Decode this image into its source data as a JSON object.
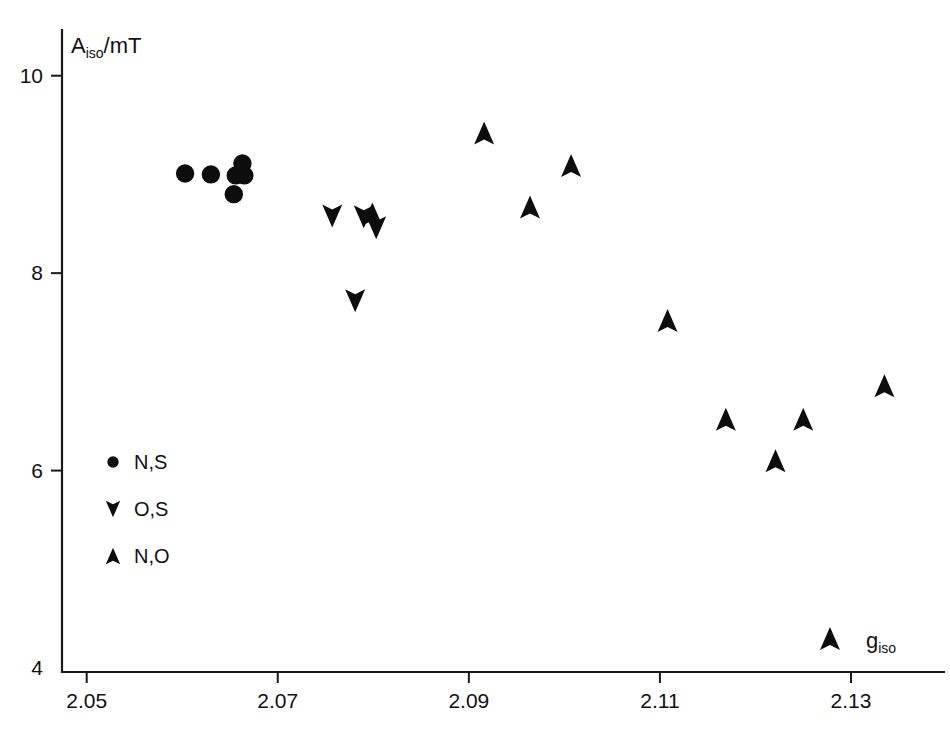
{
  "chart_data": {
    "type": "scatter",
    "title": "",
    "subtitle": "",
    "xlabel": "g_iso",
    "xlabel_base": "g",
    "xlabel_sub": "iso",
    "ylabel": "A_iso/mT",
    "ylabel_base": "A",
    "ylabel_sub": "iso",
    "ylabel_tail": "/mT",
    "xlim": [
      2.0435,
      2.1385
    ],
    "ylim": [
      4.0,
      10.55
    ],
    "xticks": [
      2.05,
      2.07,
      2.09,
      2.11,
      2.13
    ],
    "xtick_labels": [
      "2.05",
      "2.07",
      "2.09",
      "2.11",
      "2.13"
    ],
    "yticks": [
      4,
      6,
      8,
      10
    ],
    "ytick_labels": [
      "4",
      "6",
      "8",
      "10"
    ],
    "grid": false,
    "legend_position": "lower-left-inside",
    "marker_color": "#0d0d0d",
    "axis_color": "#1a1a1a",
    "series": [
      {
        "name": "N,S",
        "marker": "circle",
        "points": [
          {
            "x": 2.0603,
            "y": 9.01
          },
          {
            "x": 2.063,
            "y": 9.0
          },
          {
            "x": 2.0656,
            "y": 8.99
          },
          {
            "x": 2.0665,
            "y": 8.99
          },
          {
            "x": 2.0663,
            "y": 9.11
          },
          {
            "x": 2.0654,
            "y": 8.8
          }
        ]
      },
      {
        "name": "O,S",
        "marker": "triangle-down",
        "points": [
          {
            "x": 2.0757,
            "y": 8.58
          },
          {
            "x": 2.079,
            "y": 8.57
          },
          {
            "x": 2.0803,
            "y": 8.46
          },
          {
            "x": 2.0781,
            "y": 7.72
          }
        ]
      },
      {
        "name": "N,O",
        "marker": "triangle-up",
        "points": [
          {
            "x": 2.0799,
            "y": 8.6
          },
          {
            "x": 2.0916,
            "y": 9.42
          },
          {
            "x": 2.1007,
            "y": 9.09
          },
          {
            "x": 2.0964,
            "y": 8.67
          },
          {
            "x": 2.1108,
            "y": 7.52
          },
          {
            "x": 2.1169,
            "y": 6.52
          },
          {
            "x": 2.1221,
            "y": 6.1
          },
          {
            "x": 2.125,
            "y": 6.52
          },
          {
            "x": 2.1278,
            "y": 4.3
          },
          {
            "x": 2.1335,
            "y": 6.86
          }
        ]
      }
    ],
    "legend": [
      {
        "label": "N,S",
        "marker": "circle"
      },
      {
        "label": "O,S",
        "marker": "triangle-down"
      },
      {
        "label": "N,O",
        "marker": "triangle-up"
      }
    ]
  }
}
